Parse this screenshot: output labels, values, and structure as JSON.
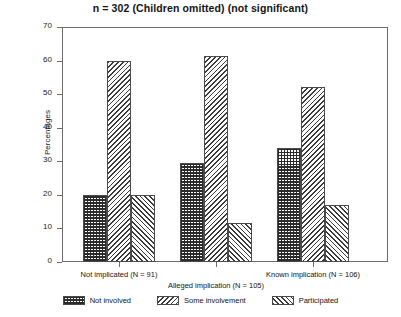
{
  "chart_data": {
    "type": "bar",
    "title": "n = 302 (Children omitted) (not significant)",
    "xlabel": "",
    "ylabel": "Percentages",
    "ylim": [
      0,
      70
    ],
    "yticks": [
      0,
      10,
      20,
      30,
      40,
      50,
      60,
      70
    ],
    "grid": false,
    "legend_position": "bottom",
    "categories": [
      "Not implicated (N = 91)",
      "Alleged implication (N = 105)",
      "Known implication (N = 106)"
    ],
    "series": [
      {
        "name": "Not involved",
        "pattern": "crosshatch",
        "values": [
          20.0,
          29.5,
          34.0
        ]
      },
      {
        "name": "Some involvement",
        "pattern": "backslash-hatch",
        "values": [
          60.0,
          61.5,
          52.0
        ]
      },
      {
        "name": "Participated",
        "pattern": "slash-hatch",
        "values": [
          20.0,
          11.5,
          17.0
        ]
      }
    ]
  },
  "axis": {
    "y_title": "Percentages",
    "y_tick_labels": [
      "70",
      "60",
      "50",
      "40",
      "30",
      "20",
      "10",
      "0"
    ]
  },
  "legend": {
    "items": [
      {
        "label": "Not involved"
      },
      {
        "label": "Some involvement"
      },
      {
        "label": "Participated"
      }
    ]
  }
}
